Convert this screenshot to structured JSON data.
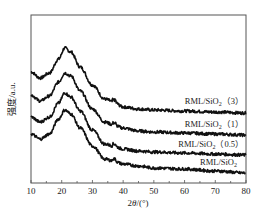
{
  "chart_data": {
    "type": "line",
    "title": "",
    "xlabel": "2θ/(°)",
    "ylabel": "强度/a.u.",
    "xlim": [
      10,
      80
    ],
    "x_ticks": [
      10,
      20,
      30,
      40,
      50,
      60,
      70,
      80
    ],
    "y_ticks": [],
    "grid": false,
    "legend_position": "inline-right",
    "x": [
      10,
      13,
      16,
      19,
      21,
      23,
      26,
      30,
      34,
      37,
      40,
      45,
      50,
      60,
      70,
      80
    ],
    "series": [
      {
        "name": "RML/SiO2 (3)",
        "label_text": "RML/SiO",
        "label_sub": "2",
        "label_suffix": "（3）",
        "values": [
          111,
          105,
          110,
          124,
          135,
          131,
          116,
          98,
          84,
          81,
          76,
          74,
          73,
          72,
          71,
          70
        ]
      },
      {
        "name": "RML/SiO2 (1)",
        "label_text": "RML/SiO",
        "label_sub": "2",
        "label_suffix": "（1）",
        "values": [
          88,
          82,
          87,
          101,
          110,
          107,
          92,
          74,
          61,
          58,
          55,
          52,
          51,
          50,
          49,
          48
        ]
      },
      {
        "name": "RML/SiO2 (0.5)",
        "label_text": "RML/SiO",
        "label_sub": "2",
        "label_suffix": "（0.5）",
        "values": [
          66,
          61,
          66,
          80,
          90,
          86,
          72,
          53,
          39,
          37,
          34,
          32,
          31,
          30,
          29,
          28
        ]
      },
      {
        "name": "RML/SiO2",
        "label_text": "RML/SiO",
        "label_sub": "2",
        "label_suffix": "",
        "values": [
          49,
          44,
          49,
          64,
          73,
          69,
          55,
          37,
          24,
          22,
          19,
          17,
          15,
          14,
          12,
          10
        ]
      }
    ],
    "annotations": []
  },
  "colors": {
    "line": "#111111",
    "axis": "#333333",
    "background": "#ffffff"
  }
}
